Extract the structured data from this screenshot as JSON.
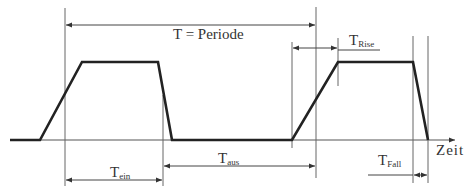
{
  "diagram": {
    "labels": {
      "period": "T = Periode",
      "rise_main": "T",
      "rise_sub": "Rise",
      "fall_main": "T",
      "fall_sub": "Fall",
      "on_main": "T",
      "on_sub": "ein",
      "off_main": "T",
      "off_sub": "aus",
      "time_axis": "Zeit"
    },
    "colors": {
      "signal": "#222222",
      "guide": "#555555",
      "text": "#333333",
      "background": "#ffffff"
    }
  }
}
